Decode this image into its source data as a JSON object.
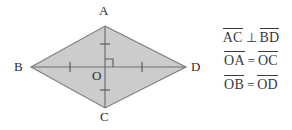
{
  "figure": {
    "type": "geometry-diagram",
    "shape_name": "rhombus",
    "fill_color": "#cccccc",
    "stroke_color": "#666666",
    "text_color": "#3a3a3a",
    "background_color": "#ffffff",
    "vertices": [
      {
        "label": "A",
        "position": "top",
        "x": 105,
        "y": 26
      },
      {
        "label": "B",
        "position": "left",
        "x": 31,
        "y": 67
      },
      {
        "label": "C",
        "position": "bottom",
        "x": 105,
        "y": 108
      },
      {
        "label": "D",
        "position": "right",
        "x": 186,
        "y": 67
      }
    ],
    "center": {
      "label": "O",
      "x": 105,
      "y": 67
    },
    "diagonals": [
      {
        "name": "AC",
        "from": "A",
        "to": "C",
        "orientation": "vertical"
      },
      {
        "name": "BD",
        "from": "B",
        "to": "D",
        "orientation": "horizontal"
      }
    ],
    "right_angle_marker": {
      "at": "O",
      "quadrant": "upper-right",
      "size": 7
    },
    "tick_marks": [
      {
        "segment": "OA",
        "count": 1,
        "orientation": "horizontal"
      },
      {
        "segment": "OC",
        "count": 1,
        "orientation": "horizontal"
      },
      {
        "segment": "OB",
        "count": 1,
        "orientation": "vertical"
      },
      {
        "segment": "OD",
        "count": 1,
        "orientation": "vertical"
      }
    ]
  },
  "equations": [
    {
      "id": "perpendicular-diagonals",
      "left_segment": "AC",
      "relation": "⊥",
      "right_segment": "BD"
    },
    {
      "id": "oa-equals-oc",
      "left_segment": "OA",
      "relation": "=",
      "right_segment": "OC"
    },
    {
      "id": "ob-equals-od",
      "left_segment": "OB",
      "relation": "=",
      "right_segment": "OD"
    }
  ]
}
